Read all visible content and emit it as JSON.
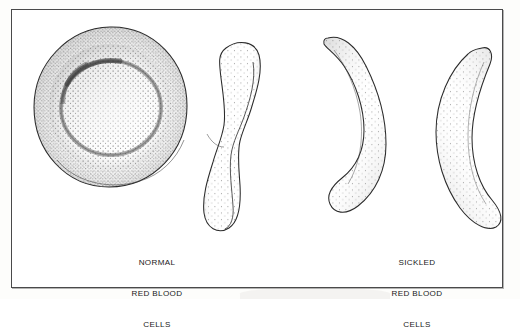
{
  "figure": {
    "title_alt": "Normal and sickled red blood cells",
    "background_color": "#fdfdfb",
    "frame_color": "#4a4a4a",
    "ink_color": "#1a1a1a",
    "stipple_color": "#3c3c3c"
  },
  "captions": {
    "normal": {
      "lines": [
        "NORMAL",
        "RED BLOOD",
        "CELLS"
      ],
      "line1": "NORMAL",
      "line2": "RED BLOOD",
      "line3": "CELLS"
    },
    "sickled": {
      "lines": [
        "SICKLED",
        "RED BLOOD",
        "CELLS"
      ],
      "line1": "SICKLED",
      "line2": "RED BLOOD",
      "line3": "CELLS"
    }
  },
  "cells": [
    {
      "id": "normal-disc-face",
      "label": "normal red blood cell, face view",
      "shape": "biconcave disc",
      "group": "normal"
    },
    {
      "id": "normal-disc-side",
      "label": "normal red blood cell, side view",
      "shape": "dumbbell / pinched profile",
      "group": "normal"
    },
    {
      "id": "sickle-cell-1",
      "label": "sickled red blood cell, S-curve",
      "shape": "sickle",
      "group": "sickled"
    },
    {
      "id": "sickle-cell-2",
      "label": "sickled red blood cell, crescent",
      "shape": "crescent",
      "group": "sickled"
    }
  ]
}
